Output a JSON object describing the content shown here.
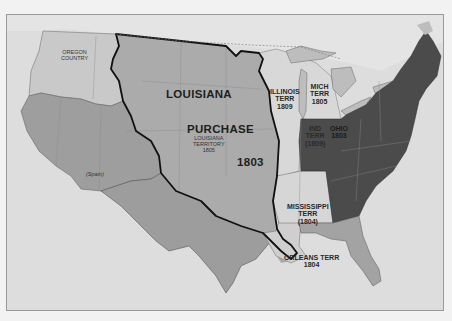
{
  "map": {
    "title": "Louisiana Purchase 1803",
    "colors": {
      "ocean": "#dcdcdc",
      "canada": "#e2e2e2",
      "oregon_country": "#c6c6c6",
      "spain": "#9e9e9e",
      "louisiana_purchase": "#a9a9a9",
      "territories": "#d6d6d6",
      "states": "#4a4a4a",
      "spanish_florida": "#a3a3a3",
      "purchase_border": "#111111"
    },
    "labels": {
      "oregon": [
        "OREGON",
        "COUNTRY"
      ],
      "louisiana": "LOUISIANA",
      "purchase": "PURCHASE",
      "louisiana_territory": [
        "LOUISIANA",
        "TERRITORY",
        "1805"
      ],
      "year": "1803",
      "spain": "(Spain)",
      "illinois": [
        "ILLINOIS",
        "TERR",
        "1809"
      ],
      "michigan": [
        "MICH",
        "TERR",
        "1805"
      ],
      "indiana": [
        "IND",
        "TERR",
        "(1809)"
      ],
      "ohio": [
        "OHIO",
        "1803"
      ],
      "mississippi": [
        "MISSISSIPPI",
        "TERR",
        "(1804)"
      ],
      "orleans": [
        "ORLEANS TERR",
        "1804"
      ]
    }
  }
}
